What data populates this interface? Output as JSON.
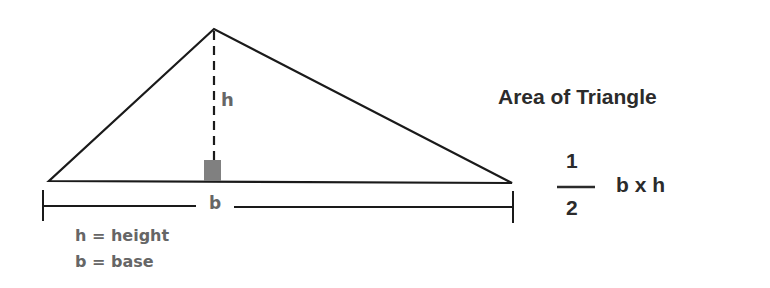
{
  "diagram": {
    "title": "Area of Triangle",
    "labels": {
      "height_symbol": "h",
      "base_symbol": "b"
    },
    "legend": [
      {
        "text": "h = height"
      },
      {
        "text": "b = base"
      }
    ],
    "formula": {
      "numerator": "1",
      "denominator": "2",
      "expression": "b x h"
    },
    "colors": {
      "lines": "#1a1a1a",
      "right_angle_marker": "#808080",
      "legend_text": "#666666",
      "title_text": "#2b2b2b"
    }
  }
}
